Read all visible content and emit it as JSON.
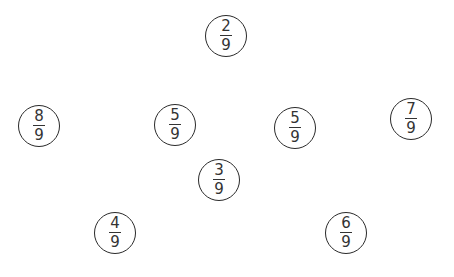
{
  "fractions": [
    {
      "id": "f1",
      "numerator": "2",
      "denominator": "9",
      "cx": 226,
      "cy": 36
    },
    {
      "id": "f2",
      "numerator": "8",
      "denominator": "9",
      "cx": 39,
      "cy": 126
    },
    {
      "id": "f3",
      "numerator": "5",
      "denominator": "9",
      "cx": 175,
      "cy": 125
    },
    {
      "id": "f4",
      "numerator": "5",
      "denominator": "9",
      "cx": 295,
      "cy": 128
    },
    {
      "id": "f5",
      "numerator": "7",
      "denominator": "9",
      "cx": 411,
      "cy": 119
    },
    {
      "id": "f6",
      "numerator": "3",
      "denominator": "9",
      "cx": 219,
      "cy": 180
    },
    {
      "id": "f7",
      "numerator": "4",
      "denominator": "9",
      "cx": 115,
      "cy": 233
    },
    {
      "id": "f8",
      "numerator": "6",
      "denominator": "9",
      "cx": 346,
      "cy": 233
    }
  ],
  "style": {
    "circle_stroke": "#2a2a2a",
    "text_color": "#333333",
    "background": "#ffffff"
  }
}
